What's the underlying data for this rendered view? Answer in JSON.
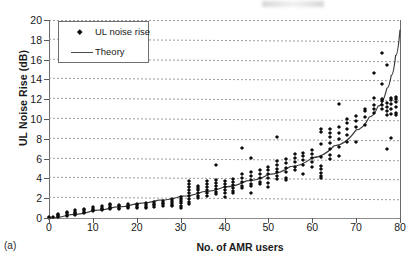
{
  "figure": {
    "subfigure_label": "(a)",
    "axis_color": "#6b6b6b",
    "marker_color": "#0d0d0d",
    "curve_color": "#3d3d3d"
  },
  "legend": {
    "position": "top-left",
    "entries": [
      {
        "label": "UL noise rise",
        "marker": "diamond-marker-icon"
      },
      {
        "label": "Theory",
        "marker": "line-marker-icon"
      }
    ]
  },
  "chart_data": {
    "type": "scatter",
    "title": "",
    "subtitle": "",
    "xlabel": "No. of AMR users",
    "ylabel": "UL Noise Rise (dB)",
    "xlim": [
      0,
      80
    ],
    "ylim": [
      0,
      20
    ],
    "xticks": [
      0,
      10,
      20,
      30,
      40,
      50,
      60,
      70,
      80
    ],
    "yticks": [
      0,
      2,
      4,
      6,
      8,
      10,
      12,
      14,
      16,
      18,
      20
    ],
    "grid": "horizontal-dashed",
    "annotations": [
      "(a)"
    ],
    "series": [
      {
        "name": "UL noise rise",
        "type": "scatter",
        "marker": "diamond",
        "points": [
          [
            0,
            0.05
          ],
          [
            0,
            0.1
          ],
          [
            1,
            0.1
          ],
          [
            2,
            0.2
          ],
          [
            2,
            0.3
          ],
          [
            2,
            0.4
          ],
          [
            2,
            0.15
          ],
          [
            4,
            0.35
          ],
          [
            4,
            0.5
          ],
          [
            4,
            0.6
          ],
          [
            4,
            0.25
          ],
          [
            6,
            0.5
          ],
          [
            6,
            0.65
          ],
          [
            6,
            0.8
          ],
          [
            6,
            0.4
          ],
          [
            6,
            0.3
          ],
          [
            8,
            0.65
          ],
          [
            8,
            0.8
          ],
          [
            8,
            0.95
          ],
          [
            8,
            0.55
          ],
          [
            10,
            0.8
          ],
          [
            10,
            0.95
          ],
          [
            10,
            1.1
          ],
          [
            10,
            0.7
          ],
          [
            12,
            0.9
          ],
          [
            12,
            1.05
          ],
          [
            12,
            1.2
          ],
          [
            12,
            0.8
          ],
          [
            14,
            1.0
          ],
          [
            14,
            1.15
          ],
          [
            14,
            1.3
          ],
          [
            14,
            1.45
          ],
          [
            14,
            0.9
          ],
          [
            16,
            1.05
          ],
          [
            16,
            1.2
          ],
          [
            16,
            1.35
          ],
          [
            16,
            0.95
          ],
          [
            18,
            1.1
          ],
          [
            18,
            1.25
          ],
          [
            18,
            1.4
          ],
          [
            18,
            1.0
          ],
          [
            20,
            1.15
          ],
          [
            20,
            1.3
          ],
          [
            20,
            1.45
          ],
          [
            20,
            1.05
          ],
          [
            22,
            1.15
          ],
          [
            22,
            1.3
          ],
          [
            22,
            1.5
          ],
          [
            22,
            1.0
          ],
          [
            24,
            1.3
          ],
          [
            24,
            1.45
          ],
          [
            24,
            1.6
          ],
          [
            24,
            1.15
          ],
          [
            26,
            1.4
          ],
          [
            26,
            1.55
          ],
          [
            26,
            1.75
          ],
          [
            26,
            1.25
          ],
          [
            28,
            1.5
          ],
          [
            28,
            1.7
          ],
          [
            28,
            1.9
          ],
          [
            28,
            1.3
          ],
          [
            28,
            1.2
          ],
          [
            30,
            1.2
          ],
          [
            30,
            1.5
          ],
          [
            30,
            1.7
          ],
          [
            30,
            1.9
          ],
          [
            30,
            2.1
          ],
          [
            30,
            1.0
          ],
          [
            32,
            1.6
          ],
          [
            32,
            1.9
          ],
          [
            32,
            2.2
          ],
          [
            32,
            2.5
          ],
          [
            32,
            2.8
          ],
          [
            32,
            3.1
          ],
          [
            32,
            3.4
          ],
          [
            32,
            3.75
          ],
          [
            32,
            1.4
          ],
          [
            34,
            2.2
          ],
          [
            34,
            2.5
          ],
          [
            34,
            2.8
          ],
          [
            34,
            3.0
          ],
          [
            34,
            3.2
          ],
          [
            34,
            2.0
          ],
          [
            36,
            2.5
          ],
          [
            36,
            2.8
          ],
          [
            36,
            3.1
          ],
          [
            36,
            3.4
          ],
          [
            36,
            3.7
          ],
          [
            36,
            2.2
          ],
          [
            38,
            2.6
          ],
          [
            38,
            2.9
          ],
          [
            38,
            3.2
          ],
          [
            38,
            3.5
          ],
          [
            38,
            3.8
          ],
          [
            38,
            5.35
          ],
          [
            38,
            2.4
          ],
          [
            40,
            2.1
          ],
          [
            40,
            2.8
          ],
          [
            40,
            3.1
          ],
          [
            40,
            3.4
          ],
          [
            40,
            3.7
          ],
          [
            40,
            2.5
          ],
          [
            42,
            2.5
          ],
          [
            42,
            3.0
          ],
          [
            42,
            3.3
          ],
          [
            42,
            3.6
          ],
          [
            42,
            3.9
          ],
          [
            42,
            2.7
          ],
          [
            44,
            3.2
          ],
          [
            44,
            3.6
          ],
          [
            44,
            4.0
          ],
          [
            44,
            4.4
          ],
          [
            44,
            7.05
          ],
          [
            44,
            3.0
          ],
          [
            46,
            2.55
          ],
          [
            46,
            3.4
          ],
          [
            46,
            3.8
          ],
          [
            46,
            4.2
          ],
          [
            46,
            4.6
          ],
          [
            46,
            6.1
          ],
          [
            46,
            3.2
          ],
          [
            48,
            3.6
          ],
          [
            48,
            4.0
          ],
          [
            48,
            4.4
          ],
          [
            48,
            4.8
          ],
          [
            48,
            3.4
          ],
          [
            50,
            3.5
          ],
          [
            50,
            4.0
          ],
          [
            50,
            4.4
          ],
          [
            50,
            4.8
          ],
          [
            50,
            5.2
          ],
          [
            50,
            3.1
          ],
          [
            52,
            4.2
          ],
          [
            52,
            4.6
          ],
          [
            52,
            5.0
          ],
          [
            52,
            5.4
          ],
          [
            52,
            5.8
          ],
          [
            52,
            8.15
          ],
          [
            52,
            3.9
          ],
          [
            54,
            4.0
          ],
          [
            54,
            4.6
          ],
          [
            54,
            5.1
          ],
          [
            54,
            5.6
          ],
          [
            54,
            6.0
          ],
          [
            54,
            3.8
          ],
          [
            56,
            5.2
          ],
          [
            56,
            5.7
          ],
          [
            56,
            6.1
          ],
          [
            56,
            6.45
          ],
          [
            56,
            4.8
          ],
          [
            58,
            5.4
          ],
          [
            58,
            5.9
          ],
          [
            58,
            6.3
          ],
          [
            58,
            6.6
          ],
          [
            58,
            4.4
          ],
          [
            60,
            5.7
          ],
          [
            60,
            6.1
          ],
          [
            60,
            6.5
          ],
          [
            60,
            6.9
          ],
          [
            60,
            5.2
          ],
          [
            62,
            4.2
          ],
          [
            62,
            4.5
          ],
          [
            62,
            4.9
          ],
          [
            62,
            5.3
          ],
          [
            62,
            6.2
          ],
          [
            62,
            7.5
          ],
          [
            62,
            8.7
          ],
          [
            62,
            9.0
          ],
          [
            62,
            4.0
          ],
          [
            64,
            6.4
          ],
          [
            64,
            7.0
          ],
          [
            64,
            7.6
          ],
          [
            64,
            8.2
          ],
          [
            64,
            8.6
          ],
          [
            64,
            9.0
          ],
          [
            64,
            6.0
          ],
          [
            66,
            6.3
          ],
          [
            66,
            7.2
          ],
          [
            66,
            8.0
          ],
          [
            66,
            8.6
          ],
          [
            66,
            9.2
          ],
          [
            66,
            11.5
          ],
          [
            68,
            7.7
          ],
          [
            68,
            8.4
          ],
          [
            68,
            9.0
          ],
          [
            68,
            9.6
          ],
          [
            68,
            10.0
          ],
          [
            70,
            9.2
          ],
          [
            70,
            9.8
          ],
          [
            70,
            10.3
          ],
          [
            70,
            7.7
          ],
          [
            72,
            10.2
          ],
          [
            72,
            10.8
          ],
          [
            72,
            11.0
          ],
          [
            72,
            9.4
          ],
          [
            74,
            10.6
          ],
          [
            74,
            11.0
          ],
          [
            74,
            11.4
          ],
          [
            74,
            12.1
          ],
          [
            74,
            14.6
          ],
          [
            76,
            11.0
          ],
          [
            76,
            11.4
          ],
          [
            76,
            11.8
          ],
          [
            76,
            12.0
          ],
          [
            76,
            13.5
          ],
          [
            76,
            16.7
          ],
          [
            77,
            10.4
          ],
          [
            77,
            10.8
          ],
          [
            77,
            11.2
          ],
          [
            77,
            11.6
          ],
          [
            77,
            15.5
          ],
          [
            77,
            6.95
          ],
          [
            78,
            10.5
          ],
          [
            78,
            11.0
          ],
          [
            78,
            11.5
          ],
          [
            78,
            11.9
          ],
          [
            78,
            12.15
          ],
          [
            78,
            8.1
          ],
          [
            79,
            10.6
          ],
          [
            79,
            11.2
          ],
          [
            79,
            11.7
          ],
          [
            79,
            12.0
          ],
          [
            79,
            12.2
          ],
          [
            79,
            10.4
          ]
        ]
      },
      {
        "name": "Theory",
        "type": "line",
        "points": [
          [
            0,
            0.0
          ],
          [
            5,
            0.35
          ],
          [
            10,
            0.75
          ],
          [
            15,
            1.1
          ],
          [
            20,
            1.45
          ],
          [
            25,
            1.8
          ],
          [
            30,
            2.2
          ],
          [
            35,
            2.65
          ],
          [
            40,
            3.15
          ],
          [
            45,
            3.75
          ],
          [
            50,
            4.4
          ],
          [
            55,
            5.2
          ],
          [
            60,
            6.1
          ],
          [
            65,
            7.3
          ],
          [
            70,
            8.9
          ],
          [
            73,
            10.2
          ],
          [
            75,
            11.3
          ],
          [
            77,
            13.1
          ],
          [
            78,
            14.4
          ],
          [
            79,
            16.4
          ],
          [
            80,
            19.0
          ]
        ]
      }
    ]
  }
}
